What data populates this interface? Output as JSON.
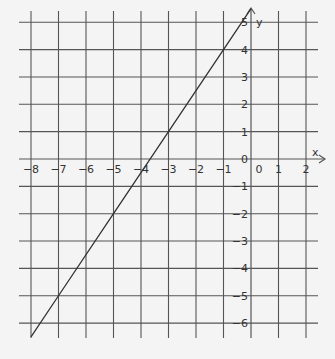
{
  "chart_data": {
    "type": "line",
    "title": "",
    "xlabel": "x",
    "ylabel": "y",
    "xlim": [
      -8,
      2
    ],
    "ylim": [
      -6,
      5
    ],
    "grid": true,
    "x_ticks": [
      -8,
      -7,
      -6,
      -5,
      -4,
      -3,
      -2,
      -1,
      0,
      1,
      2
    ],
    "y_ticks": [
      5,
      4,
      3,
      2,
      1,
      0,
      -1,
      -2,
      -3,
      -4,
      -5,
      -6
    ],
    "series": [
      {
        "name": "y = 1.5x + 5.5",
        "x": [
          -8,
          -7,
          -5,
          -3,
          -1,
          0
        ],
        "y": [
          -6.5,
          -5,
          -2,
          1,
          4,
          5.5
        ]
      }
    ]
  },
  "colors": {
    "background": "#f4f4f4",
    "grid": "#555555",
    "line": "#333333",
    "text": "#333333"
  }
}
